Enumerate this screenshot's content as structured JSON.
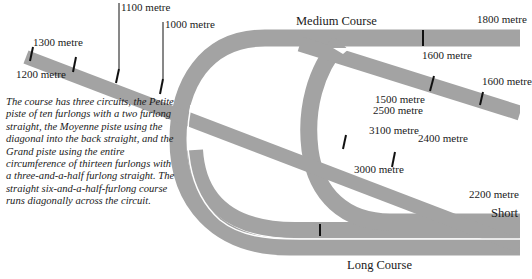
{
  "colors": {
    "track": "#a3a3a3",
    "marker": "#111111",
    "background": "#ffffff",
    "rail": "#ffffff"
  },
  "courses": {
    "medium": "Medium Course",
    "long": "Long Course",
    "short": "Short"
  },
  "distance_markers": {
    "m1300": "1300 metre",
    "m1200": "1200 metre",
    "m1100": "1100 metre",
    "m1000": "1000 metre",
    "m1800": "1800 metre",
    "m1600_top": "1600 metre",
    "m1600_right": "1600 metre",
    "m1500": "1500 metre",
    "m2500": "2500 metre",
    "m3100": "3100 metre",
    "m2400": "2400 metre",
    "m3000": "3000 metre",
    "m2200": "2200 metre"
  },
  "description": "The course has three circuits, the Petite piste of ten furlongs with a two furlong straight, the Moyenne piste using the diagonal into the back straight, and the Grand piste using the entire circumference of thirteen furlongs with a three-and-a-half furlong straight. The straight six-and-a-half-furlong course runs diagonally across the circuit."
}
